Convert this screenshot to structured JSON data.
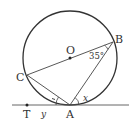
{
  "diagram": {
    "type": "geometry-circle-tangent",
    "colors": {
      "stroke": "#333333",
      "background": "#ffffff"
    },
    "circle": {
      "center_label": "O",
      "cx": 70,
      "cy": 58,
      "r": 47
    },
    "points": {
      "O": {
        "label": "O",
        "x": 70,
        "y": 58
      },
      "A": {
        "label": "A",
        "x": 70,
        "y": 105
      },
      "B": {
        "label": "B",
        "x": 113,
        "y": 42
      },
      "C": {
        "label": "C",
        "x": 27,
        "y": 75
      },
      "T": {
        "label": "T",
        "x": 27,
        "y": 105
      }
    },
    "segments": [
      "C-B (diameter through O)",
      "C-A",
      "A-B",
      "tangent line through T and A"
    ],
    "angles": {
      "angle_B": {
        "label": "35°",
        "value": 35
      },
      "angle_x": {
        "label": "x"
      },
      "angle_y": {
        "label": "y"
      }
    }
  }
}
